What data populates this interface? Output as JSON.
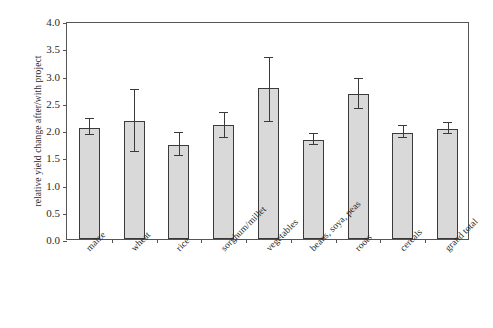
{
  "chart_data": {
    "type": "bar",
    "title": "",
    "xlabel": "",
    "ylabel": "relative yield change after/with project",
    "ylim": [
      0.0,
      4.0
    ],
    "ytick_labels": [
      "0.0",
      "0.5",
      "1.0",
      "1.5",
      "2.0",
      "2.5",
      "3.0",
      "3.5",
      "4.0"
    ],
    "ytick_values": [
      0.0,
      0.5,
      1.0,
      1.5,
      2.0,
      2.5,
      3.0,
      3.5,
      4.0
    ],
    "grid": false,
    "legend": "none",
    "categories": [
      "maize",
      "wheat",
      "rice",
      "sorghum/millet",
      "vegetables",
      "beans, soya, peas",
      "roots",
      "cereals",
      "grand total"
    ],
    "values": [
      2.04,
      2.17,
      1.73,
      2.09,
      2.77,
      1.82,
      2.66,
      1.95,
      2.02
    ],
    "error_low": [
      1.9,
      1.6,
      1.53,
      1.86,
      2.14,
      1.73,
      2.38,
      1.85,
      1.92
    ],
    "error_high": [
      2.2,
      2.73,
      1.95,
      2.31,
      3.33,
      1.93,
      2.93,
      2.07,
      2.13
    ],
    "bar_fill_color": "#d9d9d9",
    "bar_edge_color": "#3a3a3a",
    "axis_color": "#555555",
    "background_color": "#ffffff"
  }
}
